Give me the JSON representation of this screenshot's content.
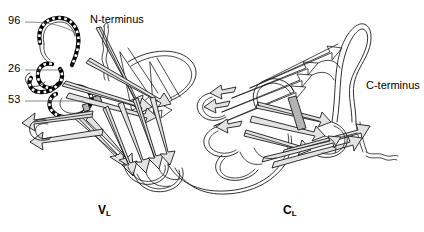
{
  "figure": {
    "type": "protein-ribbon-diagram",
    "background_color": "#ffffff",
    "line_color": "#1a1a1a",
    "sheet_fill": "#e3e3e3",
    "sheet_fill_dark": "#b4b4b4",
    "cdr_color": "#000000",
    "leader_color": "#6b6b6b"
  },
  "annotations": {
    "residue_96": "96",
    "residue_26": "26",
    "residue_53": "53",
    "n_terminus": "N-terminus",
    "c_terminus": "C-terminus"
  },
  "domains": {
    "variable": {
      "label": "V",
      "subscript": "L"
    },
    "constant": {
      "label": "C",
      "subscript": "L"
    }
  }
}
